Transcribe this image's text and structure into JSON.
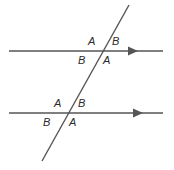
{
  "figure": {
    "stroke_color": "#555555",
    "label_color": "#2b2b2b",
    "background_color": "#ffffff",
    "line_width": 1.4
  },
  "lines": [
    {
      "name": "upper-parallel-line",
      "kind": "ray-with-arrow",
      "x1": 9,
      "y1": 51,
      "x2": 163,
      "y2": 51,
      "arrow_at": {
        "x": 134,
        "y": 51
      },
      "direction": "right"
    },
    {
      "name": "lower-parallel-line",
      "kind": "ray-with-arrow",
      "x1": 9,
      "y1": 113,
      "x2": 163,
      "y2": 113,
      "arrow_at": {
        "x": 139,
        "y": 113
      },
      "direction": "right"
    },
    {
      "name": "transversal-line",
      "kind": "segment",
      "x1": 129,
      "y1": 5,
      "x2": 42,
      "y2": 161
    }
  ],
  "intersections": [
    {
      "name": "upper-intersection",
      "x": 100,
      "y": 51
    },
    {
      "name": "lower-intersection",
      "x": 67,
      "y": 113
    }
  ],
  "labels": [
    {
      "id": "upper-left-above",
      "text": "A",
      "x": 88,
      "y": 36,
      "position": "upper-intersection / above-left"
    },
    {
      "id": "upper-right-above",
      "text": "B",
      "x": 112,
      "y": 36,
      "position": "upper-intersection / above-right"
    },
    {
      "id": "upper-left-below",
      "text": "B",
      "x": 78,
      "y": 55,
      "position": "upper-intersection / below-left"
    },
    {
      "id": "upper-right-below",
      "text": "A",
      "x": 103,
      "y": 55,
      "position": "upper-intersection / below-right"
    },
    {
      "id": "lower-left-above",
      "text": "A",
      "x": 54,
      "y": 98,
      "position": "lower-intersection / above-left"
    },
    {
      "id": "lower-right-above",
      "text": "B",
      "x": 78,
      "y": 98,
      "position": "lower-intersection / above-right"
    },
    {
      "id": "lower-left-below",
      "text": "B",
      "x": 43,
      "y": 117,
      "position": "lower-intersection / below-left"
    },
    {
      "id": "lower-right-below",
      "text": "A",
      "x": 69,
      "y": 117,
      "position": "lower-intersection / below-right"
    }
  ]
}
